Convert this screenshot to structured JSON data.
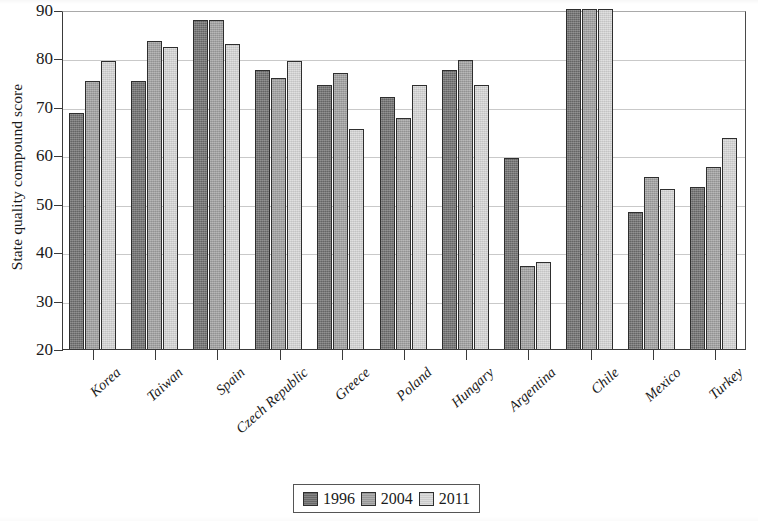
{
  "chart_data": {
    "type": "bar",
    "title": "",
    "xlabel": "",
    "ylabel": "State quality compound score",
    "ylim": [
      20,
      90
    ],
    "ytick_step": 10,
    "yticks": [
      90,
      80,
      70,
      60,
      50,
      40,
      30,
      20
    ],
    "grid": true,
    "legend_position": "bottom-center",
    "categories": [
      "Korea",
      "Taiwan",
      "Spain",
      "Czech Republic",
      "Greece",
      "Poland",
      "Hungary",
      "Argentina",
      "Chile",
      "Mexico",
      "Turkey"
    ],
    "series": [
      {
        "name": "1996",
        "color": "#6e6e6e",
        "values": [
          68.7,
          75.3,
          88.0,
          77.6,
          74.6,
          72.0,
          77.6,
          59.4,
          90.3,
          48.2,
          53.4
        ]
      },
      {
        "name": "2004",
        "color": "#a0a0a0",
        "values": [
          75.3,
          83.7,
          88.0,
          75.9,
          77.0,
          67.6,
          79.7,
          37.1,
          90.3,
          55.5,
          57.6
        ]
      },
      {
        "name": "2011",
        "color": "#d6d6d6",
        "values": [
          79.4,
          82.4,
          83.0,
          79.5,
          65.4,
          74.5,
          74.6,
          37.9,
          90.3,
          53.0,
          63.5
        ]
      }
    ]
  },
  "legend": {
    "items": [
      {
        "label": "1996",
        "color": "#6e6e6e"
      },
      {
        "label": "2004",
        "color": "#a0a0a0"
      },
      {
        "label": "2011",
        "color": "#d6d6d6"
      }
    ]
  }
}
